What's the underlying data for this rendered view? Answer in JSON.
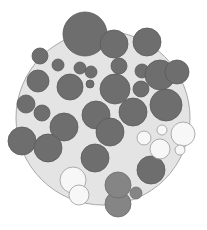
{
  "diagram": {
    "type": "circle-packing",
    "colors": {
      "background": "#ffffff",
      "container_fill": "#e4e4e4",
      "container_stroke": "#a8a8a8",
      "dark_fill": "#6e6e6e",
      "dark_stroke": "#5a5a5a",
      "mid_fill": "#858585",
      "mid_stroke": "#6c6c6c",
      "light_fill": "#f7f7f7",
      "light_stroke": "#9a9a9a"
    },
    "container": {
      "cx": 103,
      "cy": 118,
      "r": 87
    },
    "circles": [
      {
        "cx": 85,
        "cy": 34,
        "r": 22,
        "tone": "dark"
      },
      {
        "cx": 114,
        "cy": 44,
        "r": 14,
        "tone": "dark"
      },
      {
        "cx": 147,
        "cy": 42,
        "r": 14,
        "tone": "dark"
      },
      {
        "cx": 40,
        "cy": 56,
        "r": 8,
        "tone": "dark"
      },
      {
        "cx": 58,
        "cy": 65,
        "r": 6,
        "tone": "dark"
      },
      {
        "cx": 80,
        "cy": 68,
        "r": 6,
        "tone": "dark"
      },
      {
        "cx": 91,
        "cy": 72,
        "r": 6,
        "tone": "dark"
      },
      {
        "cx": 90,
        "cy": 84,
        "r": 4,
        "tone": "dark"
      },
      {
        "cx": 119,
        "cy": 66,
        "r": 8,
        "tone": "dark"
      },
      {
        "cx": 142,
        "cy": 71,
        "r": 7,
        "tone": "dark"
      },
      {
        "cx": 160,
        "cy": 75,
        "r": 15,
        "tone": "dark"
      },
      {
        "cx": 177,
        "cy": 72,
        "r": 12,
        "tone": "dark"
      },
      {
        "cx": 38,
        "cy": 81,
        "r": 11,
        "tone": "dark"
      },
      {
        "cx": 70,
        "cy": 87,
        "r": 13,
        "tone": "dark"
      },
      {
        "cx": 115,
        "cy": 89,
        "r": 15,
        "tone": "dark"
      },
      {
        "cx": 141,
        "cy": 89,
        "r": 8,
        "tone": "dark"
      },
      {
        "cx": 166,
        "cy": 105,
        "r": 16,
        "tone": "dark"
      },
      {
        "cx": 26,
        "cy": 104,
        "r": 9,
        "tone": "dark"
      },
      {
        "cx": 42,
        "cy": 113,
        "r": 8,
        "tone": "dark"
      },
      {
        "cx": 96,
        "cy": 115,
        "r": 14,
        "tone": "dark"
      },
      {
        "cx": 133,
        "cy": 112,
        "r": 14,
        "tone": "dark"
      },
      {
        "cx": 64,
        "cy": 127,
        "r": 14,
        "tone": "dark"
      },
      {
        "cx": 22,
        "cy": 141,
        "r": 14,
        "tone": "dark"
      },
      {
        "cx": 48,
        "cy": 148,
        "r": 14,
        "tone": "dark"
      },
      {
        "cx": 110,
        "cy": 132,
        "r": 14,
        "tone": "dark"
      },
      {
        "cx": 95,
        "cy": 158,
        "r": 14,
        "tone": "dark"
      },
      {
        "cx": 151,
        "cy": 170,
        "r": 14,
        "tone": "dark"
      },
      {
        "cx": 144,
        "cy": 138,
        "r": 7,
        "tone": "light"
      },
      {
        "cx": 162,
        "cy": 130,
        "r": 5,
        "tone": "light"
      },
      {
        "cx": 183,
        "cy": 134,
        "r": 12,
        "tone": "light"
      },
      {
        "cx": 160,
        "cy": 149,
        "r": 10,
        "tone": "light"
      },
      {
        "cx": 180,
        "cy": 150,
        "r": 5,
        "tone": "light"
      },
      {
        "cx": 73,
        "cy": 180,
        "r": 13,
        "tone": "light"
      },
      {
        "cx": 79,
        "cy": 195,
        "r": 10,
        "tone": "light"
      },
      {
        "cx": 136,
        "cy": 193,
        "r": 6,
        "tone": "mid"
      },
      {
        "cx": 118,
        "cy": 204,
        "r": 13,
        "tone": "mid"
      },
      {
        "cx": 118,
        "cy": 185,
        "r": 13,
        "tone": "mid"
      }
    ]
  }
}
